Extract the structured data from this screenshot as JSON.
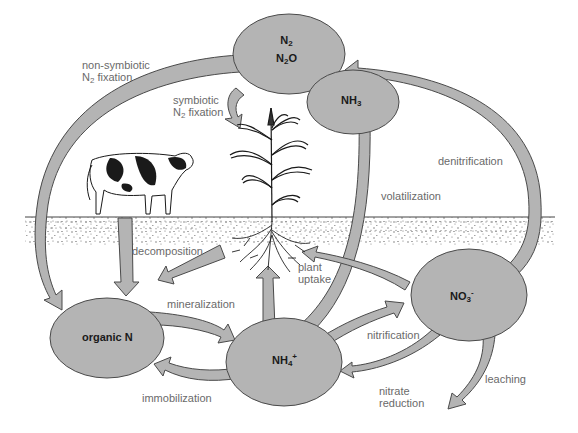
{
  "diagram": {
    "colors": {
      "fill": "#b4b4b4",
      "stroke": "#4a4a4a",
      "label_text": "#6a6a6a",
      "node_text": "#1a1a1a",
      "soil": "#5a5a5a",
      "background": "#ffffff"
    },
    "nodes": {
      "n2": {
        "line1_main": "N",
        "line1_sub": "2",
        "line2_main": "N",
        "line2_sub": "2",
        "line2_tail": "O"
      },
      "nh3": {
        "main": "NH",
        "sub": "3"
      },
      "organic_n": {
        "label": "organic N"
      },
      "nh4": {
        "main": "NH",
        "sub": "4",
        "sup": "+"
      },
      "no3": {
        "main": "NO",
        "sub": "3",
        "sup": "-"
      }
    },
    "processes": {
      "non_symbiotic": {
        "line1": "non-symbiotic",
        "line2_main": "N",
        "line2_sub": "2",
        "line2_tail": " fixation"
      },
      "symbiotic": {
        "line1": "symbiotic",
        "line2_main": "N",
        "line2_sub": "2",
        "line2_tail": " fixation"
      },
      "denitrification": "denitrification",
      "volatilization": "volatilization",
      "decomposition": "decomposition",
      "plant_uptake": {
        "line1": "plant",
        "line2": "uptake"
      },
      "mineralization": "mineralization",
      "nitrification": "nitrification",
      "immobilization": "immobilization",
      "nitrate_reduction": {
        "line1": "nitrate",
        "line2": "reduction"
      },
      "leaching": "leaching"
    },
    "illustrations": [
      "cow",
      "corn-plant",
      "plant-roots",
      "soil-surface"
    ]
  }
}
